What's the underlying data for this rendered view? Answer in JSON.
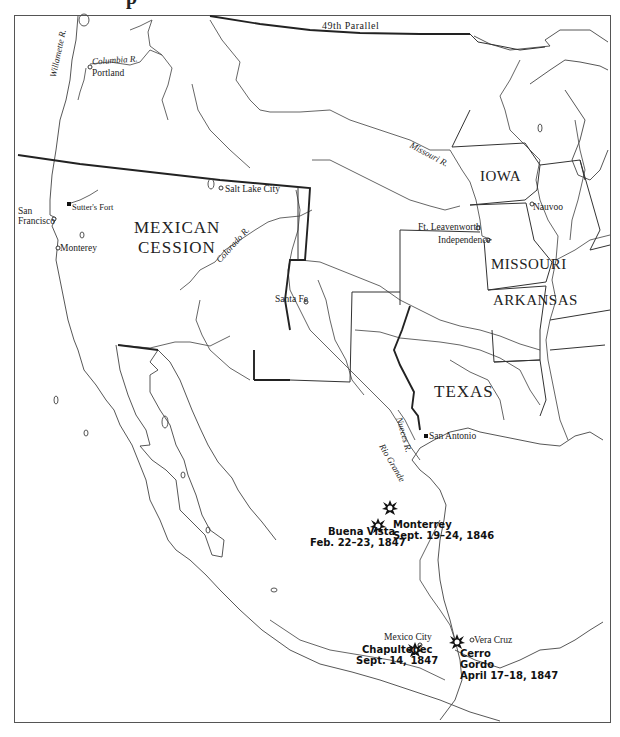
{
  "title_fragment": "p",
  "boundary_labels": {
    "parallel": "49th Parallel"
  },
  "regions": {
    "mexican_cession_line1": "MEXICAN",
    "mexican_cession_line2": "CESSION",
    "iowa": "IOWA",
    "missouri": "MISSOURI",
    "arkansas": "ARKANSAS",
    "texas": "TEXAS"
  },
  "rivers": {
    "willamette": "Willamette R.",
    "columbia": "Columbia R.",
    "colorado": "Colorado R.",
    "missouri": "Missouri R.",
    "nueces": "Nueces R.",
    "rio_grande": "Rio Grande"
  },
  "cities": {
    "portland": "Portland",
    "salt_lake_city": "Salt Lake City",
    "san_francisco_1": "San",
    "san_francisco_2": "Francisco",
    "sutters_fort": "Sutter's Fort",
    "monterey": "Monterey",
    "santa_fe": "Santa Fe",
    "ft_leavenworth": "Ft. Leavenworth",
    "independence": "Independence",
    "nauvoo": "Nauvoo",
    "san_antonio": "San Antonio",
    "mexico_city": "Mexico City",
    "vera_cruz": "Vera Cruz"
  },
  "battles": [
    {
      "name": "Monterrey",
      "date": "Sept. 19–24, 1846"
    },
    {
      "name": "Buena Vista",
      "date": "Feb. 22–23, 1847"
    },
    {
      "name": "Chapultepec",
      "date": "Sept. 14, 1847"
    },
    {
      "name_line1": "Cerro",
      "name_line2": "Gordo",
      "date": "April 17–18, 1847"
    }
  ],
  "icons": {
    "battle": "explosion-icon",
    "city": "open-circle-marker",
    "fort": "filled-square-marker"
  },
  "colors": {
    "line": "#333333",
    "background": "#ffffff",
    "text": "#222222"
  }
}
